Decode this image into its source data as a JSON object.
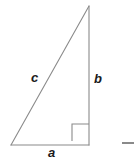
{
  "figure": {
    "background_color": "#ffffff",
    "width": 135,
    "height": 161,
    "stroke_color": "#8a8a8a",
    "label_color": "#1a1a1a",
    "stroke_width": 1.1
  },
  "triangle": {
    "name": "right-triangle",
    "vertices": {
      "apex": {
        "x": 89,
        "y": 6
      },
      "bottom_left": {
        "x": 11,
        "y": 145
      },
      "bottom_right": {
        "x": 89,
        "y": 145
      }
    },
    "sides": [
      {
        "id": "a",
        "label": "a",
        "role": "base-leg",
        "from": "bottom_left",
        "to": "bottom_right"
      },
      {
        "id": "b",
        "label": "b",
        "role": "vertical-leg",
        "from": "bottom_right",
        "to": "apex"
      },
      {
        "id": "c",
        "label": "c",
        "role": "hypotenuse",
        "from": "bottom_left",
        "to": "apex"
      }
    ]
  },
  "right_angle_marker": {
    "name": "right-angle-square",
    "x": 72,
    "y": 124,
    "size": 17,
    "at_vertex": "bottom_right"
  },
  "labels": {
    "c": "c",
    "b": "b",
    "a": "a"
  },
  "tick_mark": {
    "name": "edge-dash",
    "x": 122,
    "y": 142,
    "width": 12,
    "height": 2,
    "color": "#8a8a8a"
  }
}
